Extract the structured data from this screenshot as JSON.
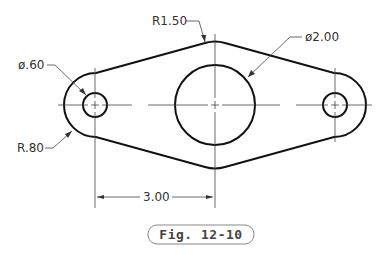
{
  "drawing": {
    "dimensions": {
      "top_radius": "R1.50",
      "large_diameter": "ø2.00",
      "small_diameter": "ø.60",
      "end_radius": "R.80",
      "hole_spacing": "3.00"
    },
    "figure_label": "Fig. 12-10",
    "colors": {
      "object_line": "#111111",
      "center_line": "#444444",
      "dimension_line": "#444444",
      "text": "#333333"
    }
  }
}
